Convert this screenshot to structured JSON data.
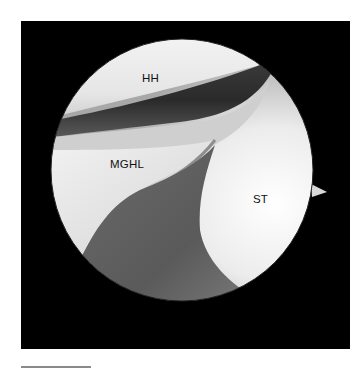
{
  "figure": {
    "type": "arthroscopic image",
    "background_color": "#000000",
    "page_color": "#ffffff",
    "labels": [
      {
        "id": "hh",
        "text": "HH",
        "x": 142,
        "y": 73
      },
      {
        "id": "mghl",
        "text": "MGHL",
        "x": 110,
        "y": 159
      },
      {
        "id": "st",
        "text": "ST",
        "x": 253,
        "y": 194
      }
    ],
    "scale_bar": {
      "visible": true,
      "color": "#8a8a8a"
    }
  }
}
